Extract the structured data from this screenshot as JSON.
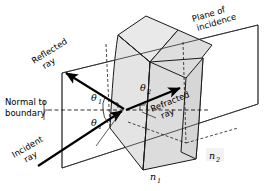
{
  "figure": {
    "background_color": "#ffffff",
    "ink_color": "#1a1a1a",
    "shade_color": "#e2e2e2",
    "shade_color_dark": "#d2d2d2"
  },
  "labels": {
    "reflected_ray_line1": "Reflected",
    "reflected_ray_line2": "ray",
    "incident_ray_line1": "Incident",
    "incident_ray_line2": "ray",
    "refracted_ray_line1": "Refracted",
    "refracted_ray_line2": "ray",
    "normal_line1": "Normal to",
    "normal_line2": "boundary",
    "plane_line1": "Plane of",
    "plane_line2": "incidence",
    "theta_sym": "θ",
    "theta1_sub": "1",
    "theta2_sub": "2",
    "n_sym": "n",
    "n1_sub": "1",
    "n2_sub": "2"
  },
  "annotations": {
    "angle_incidence": "θ₁",
    "angle_reflection": "θ₁",
    "angle_refraction": "θ₂",
    "index_medium_1": "n₁",
    "index_medium_2": "n₂"
  },
  "diagram_data": {
    "type": "optics-ray-diagram",
    "incidence_point": [
      125,
      110
    ],
    "rays": [
      {
        "name": "incident-ray",
        "from": [
          38,
          165
        ],
        "to": [
          125,
          110
        ],
        "arrow": true
      },
      {
        "name": "reflected-ray",
        "from": [
          125,
          110
        ],
        "to": [
          63,
          71
        ],
        "arrow": true
      },
      {
        "name": "refracted-ray",
        "from": [
          125,
          110
        ],
        "to": [
          183,
          86
        ],
        "arrow": true
      }
    ],
    "normal": {
      "name": "normal-to-boundary",
      "from": [
        48,
        110
      ],
      "to": [
        210,
        110
      ],
      "style": "dashed"
    },
    "media": [
      {
        "label": "n₁",
        "position": [
          115,
          178
        ],
        "side": "left"
      },
      {
        "label": "n₂",
        "position": [
          214,
          158
        ],
        "side": "right"
      }
    ]
  }
}
